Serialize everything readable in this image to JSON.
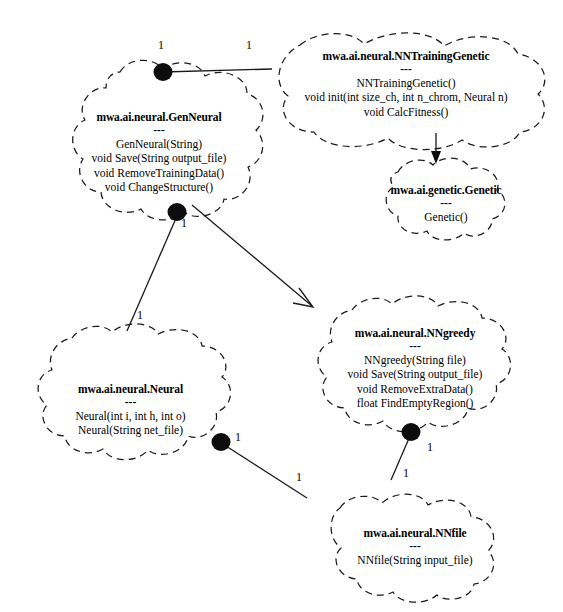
{
  "diagram": {
    "kind": "uml-class-diagram",
    "style": {
      "node_outline": "dashed-cloud",
      "line_color": "#1a1a1a",
      "background": "#ffffff",
      "text_color": "#000000"
    },
    "nodes": [
      {
        "id": "gen-neural",
        "title": "mwa.ai.neural.GenNeural",
        "separator": "---",
        "members": [
          "GenNeural(String)",
          "void Save(String output_file)",
          "void RemoveTrainingData()",
          "void ChangeStructure()"
        ]
      },
      {
        "id": "nn-training-genetic",
        "title": "mwa.ai.neural.NNTrainingGenetic",
        "separator": "---",
        "members": [
          "NNTrainingGenetic()",
          "void init(int size_ch, int n_chrom, Neural n)",
          "void CalcFitness()"
        ]
      },
      {
        "id": "genetic",
        "title": "mwa.ai.genetic.Genetic",
        "separator": "---",
        "members": [
          "Genetic()"
        ]
      },
      {
        "id": "nn-greedy",
        "title": "mwa.ai.neural.NNgreedy",
        "separator": "---",
        "members": [
          "NNgreedy(String file)",
          "void Save(String output_file)",
          "void RemoveExtraData()",
          "float FindEmptyRegion()"
        ]
      },
      {
        "id": "neural",
        "title": "mwa.ai.neural.Neural",
        "separator": "---",
        "members": [
          "Neural(int i, int h, int o)",
          "Neural(String net_file)"
        ]
      },
      {
        "id": "nn-file",
        "title": "mwa.ai.neural.NNfile",
        "separator": "---",
        "members": [
          "NNfile(String input_file)"
        ]
      }
    ],
    "multiplicity_labels": [
      {
        "id": "m1",
        "text": "1"
      },
      {
        "id": "m2",
        "text": "1"
      },
      {
        "id": "m3",
        "text": "1"
      },
      {
        "id": "m4",
        "text": "1"
      },
      {
        "id": "m5",
        "text": "1"
      },
      {
        "id": "m6",
        "text": "1"
      },
      {
        "id": "m7",
        "text": "1"
      },
      {
        "id": "m8",
        "text": "1"
      }
    ],
    "edges": [
      {
        "id": "gen-neural--nn-training-genetic",
        "from": "gen-neural",
        "to": "nn-training-genetic",
        "kind": "association",
        "from_mult": "1",
        "to_mult": "1"
      },
      {
        "id": "gen-neural--neural",
        "from": "gen-neural",
        "to": "neural",
        "kind": "association",
        "from_mult": "1",
        "to_mult": "1"
      },
      {
        "id": "gen-neural--nn-greedy",
        "from": "gen-neural",
        "to": "nn-greedy",
        "kind": "directed-association"
      },
      {
        "id": "nn-training-genetic--genetic",
        "from": "nn-training-genetic",
        "to": "genetic",
        "kind": "generalization"
      },
      {
        "id": "neural--nn-file",
        "from": "neural",
        "to": "nn-file",
        "kind": "association",
        "from_mult": "1",
        "to_mult": "1"
      },
      {
        "id": "nn-greedy--nn-file",
        "from": "nn-greedy",
        "to": "nn-file",
        "kind": "association",
        "from_mult": "1",
        "to_mult": "1"
      }
    ]
  }
}
